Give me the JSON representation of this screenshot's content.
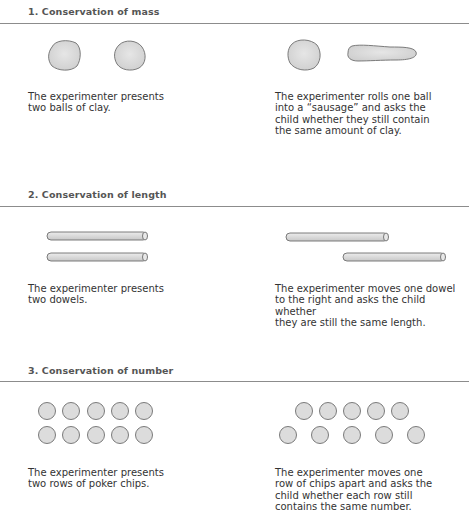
{
  "sections": [
    {
      "title": "1. Conservation of mass",
      "left_caption": "The experimenter presents\ntwo balls of clay.",
      "right_caption": "The experimenter rolls one ball\ninto a “sausage” and asks the\nchild whether they still contain\nthe same amount of clay.",
      "left_figure": "two-clay-balls",
      "right_figure": "clay-ball-and-sausage"
    },
    {
      "title": "2. Conservation of length",
      "left_caption": "The experimenter presents\ntwo dowels.",
      "right_caption": "The experimenter moves one dowel\nto the right and asks the child whether\nthey are still the same length.",
      "left_figure": "two-aligned-dowels",
      "right_figure": "offset-dowels"
    },
    {
      "title": "3. Conservation of number",
      "left_caption": "The experimenter presents\ntwo rows of poker chips.",
      "right_caption": "The experimenter moves one\nrow of chips apart and asks the\nchild whether each row still\ncontains the same number.",
      "left_figure": "two-rows-of-five-chips",
      "right_figure": "spread-row-of-chips"
    }
  ],
  "colors": {
    "heading": "#555555",
    "rule": "#8c8c8c",
    "shape_fill": "#dcdcdc",
    "shape_stroke": "#6e6e6e",
    "text": "#333333"
  }
}
